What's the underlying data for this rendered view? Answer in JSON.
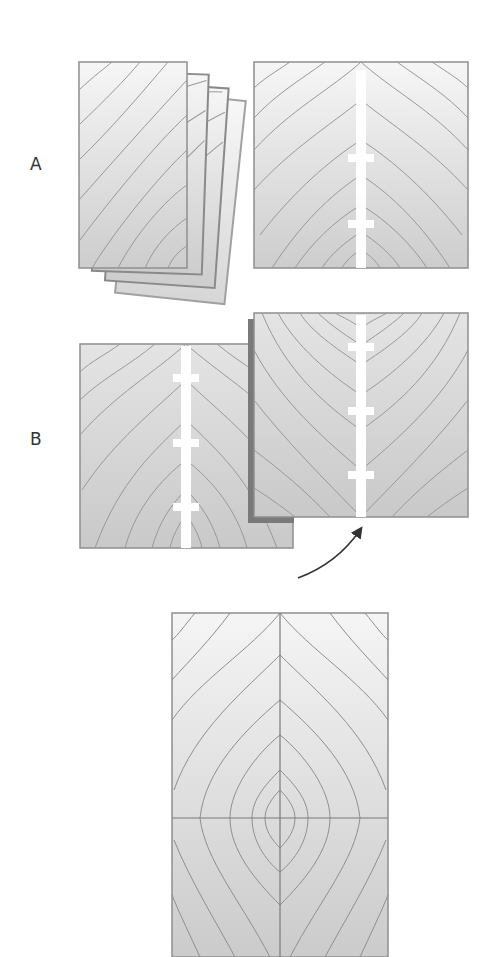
{
  "labels": {
    "step_a": "A",
    "step_b": "B"
  },
  "colors": {
    "background": "#ffffff",
    "board_light": "#f4f4f4",
    "board_dark": "#cfcfcf",
    "grain_line": "#8f8f8f",
    "board_border": "#9a9a9a",
    "joint_strip": "#ffffff",
    "shadow_edge": "#777777",
    "arrow": "#333333",
    "label_text": "#333333"
  },
  "diagram": {
    "step_a": {
      "stacked_boards": 4,
      "panel_joint_crossbars": 2
    },
    "step_b": {
      "left_panel_crossbars": 3,
      "right_panel_crossbars": 3,
      "arrow": "curved arrow indicating flip of right panel"
    },
    "result": {
      "panel": "book-matched glued panel with symmetric grain meeting at center seam",
      "center_seam": "vertical",
      "cross_line": "horizontal"
    }
  }
}
